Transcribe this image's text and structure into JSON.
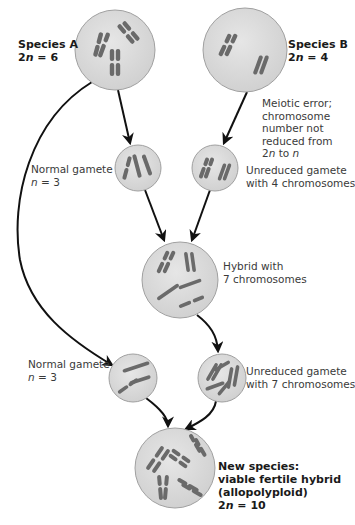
{
  "colors": {
    "cell_fill": "#dcdcdc",
    "cell_stroke": "#9a9a9a",
    "chromosome": "#6a6a6a",
    "arrow": "#111111",
    "text": "#3a3a3a"
  },
  "nodes": {
    "species_a": {
      "title": "Species A",
      "ploidy_prefix": "2",
      "ploidy_var": "n",
      "ploidy_suffix": " = 6",
      "chromosomes": 6
    },
    "species_b": {
      "title": "Species B",
      "ploidy_prefix": "2",
      "ploidy_var": "n",
      "ploidy_suffix": " = 4",
      "chromosomes": 4
    },
    "meiotic_error": {
      "line1": "Meiotic error;",
      "line2": "chromosome",
      "line3": "number not",
      "line4": "reduced from",
      "line5_a": "2",
      "line5_n1": "n",
      "line5_mid": " to ",
      "line5_n2": "n"
    },
    "normal_gamete_top": {
      "title": "Normal gamete",
      "ploidy_var": "n",
      "ploidy_suffix": " = 3",
      "chromosomes": 3
    },
    "unreduced_gamete_4": {
      "line1": "Unreduced gamete",
      "line2": "with 4 chromosomes",
      "chromosomes": 4
    },
    "hybrid": {
      "line1": "Hybrid with",
      "line2": "7 chromosomes",
      "chromosomes": 7
    },
    "normal_gamete_bottom": {
      "title": "Normal gamete",
      "ploidy_var": "n",
      "ploidy_suffix": " = 3",
      "chromosomes": 3
    },
    "unreduced_gamete_7": {
      "line1": "Unreduced gamete",
      "line2": "with 7 chromosomes",
      "chromosomes": 7
    },
    "new_species": {
      "line1": "New species:",
      "line2": "viable fertile hybrid",
      "line3": "(allopolyploid)",
      "ploidy_prefix": "2",
      "ploidy_var": "n",
      "ploidy_suffix": " = 10",
      "chromosomes": 10
    }
  },
  "edges": [
    {
      "from": "species_a",
      "to": "normal_gamete_top"
    },
    {
      "from": "species_a",
      "to": "normal_gamete_bottom"
    },
    {
      "from": "species_b",
      "to": "unreduced_gamete_4"
    },
    {
      "from": "normal_gamete_top",
      "to": "hybrid"
    },
    {
      "from": "unreduced_gamete_4",
      "to": "hybrid"
    },
    {
      "from": "hybrid",
      "to": "unreduced_gamete_7"
    },
    {
      "from": "normal_gamete_bottom",
      "to": "new_species"
    },
    {
      "from": "unreduced_gamete_7",
      "to": "new_species"
    }
  ]
}
